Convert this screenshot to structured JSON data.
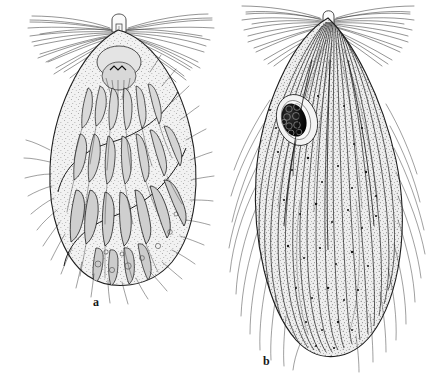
{
  "plate": {
    "background_color": "#ffffff",
    "ink_color": "#1b1b1b",
    "width": 440,
    "height": 380,
    "medium": "line-and-stipple scientific illustration"
  },
  "figures": [
    {
      "id": "figure-a",
      "label": "a",
      "label_position": {
        "x": 93,
        "y": 296
      },
      "subject": "phyllopod-limbed branchiopod, lateral view",
      "bounds": {
        "x": 28,
        "y": 8,
        "width": 177,
        "height": 282
      },
      "body_fill": "#efefef",
      "features": [
        "apical knob with vertical tube at head",
        "paired fans of antennal setae radiating left and right",
        "rows of dark banded phyllopod limbs",
        "S-curved carapace outline",
        "stippled interior with small circular cells",
        "marginal setae along lower carapace"
      ]
    },
    {
      "id": "figure-b",
      "label": "b",
      "label_position": {
        "x": 263,
        "y": 355
      },
      "subject": "ovoid branchiopod with egg mass, lateral view",
      "bounds": {
        "x": 230,
        "y": 8,
        "width": 190,
        "height": 352
      },
      "body_fill": "#ededed",
      "egg_mass": {
        "name": "dark lobed egg mass",
        "fill": "#141414",
        "center": {
          "x": 295,
          "y": 120
        },
        "width": 24,
        "height": 34
      },
      "features": [
        "rounded apex with small knob",
        "dense apical setal fans left and right",
        "long sweeping longitudinal striations",
        "dark lobed egg mass within oval capsule",
        "heavy fine stippling across body",
        "long fine setae projecting beyond outline"
      ]
    }
  ]
}
